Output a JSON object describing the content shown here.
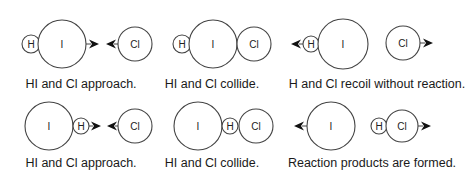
{
  "diagram": {
    "colors": {
      "stroke": "#444444",
      "arrow": "#111111",
      "text": "#1a1a1a",
      "background": "#ffffff"
    },
    "rows": [
      {
        "name": "unfavorable-orientation",
        "panels": [
          {
            "caption": "HI and Cl approach.",
            "caption_x": 81,
            "caption_y": 88,
            "atoms": [
              {
                "label": "H",
                "cx": 31,
                "cy": 44,
                "r": 9
              },
              {
                "label": "I",
                "cx": 62,
                "cy": 44,
                "r": 24
              },
              {
                "label": "Cl",
                "cx": 135,
                "cy": 44,
                "r": 17
              }
            ],
            "arrows": [
              {
                "from": 86,
                "to": 99,
                "y": 44,
                "dir": "right"
              },
              {
                "from": 118,
                "to": 106,
                "y": 44,
                "dir": "left"
              }
            ]
          },
          {
            "caption": "HI and Cl collide.",
            "caption_x": 212,
            "caption_y": 88,
            "atoms": [
              {
                "label": "H",
                "cx": 182,
                "cy": 44,
                "r": 9
              },
              {
                "label": "I",
                "cx": 213,
                "cy": 44,
                "r": 24
              },
              {
                "label": "Cl",
                "cx": 254,
                "cy": 44,
                "r": 17
              }
            ],
            "arrows": []
          },
          {
            "caption": "H and Cl recoil without reaction.",
            "caption_x": 377,
            "caption_y": 88,
            "atoms": [
              {
                "label": "H",
                "cx": 311,
                "cy": 44,
                "r": 8
              },
              {
                "label": "I",
                "cx": 343,
                "cy": 44,
                "r": 25
              },
              {
                "label": "Cl",
                "cx": 403,
                "cy": 43,
                "r": 17
              }
            ],
            "arrows": [
              {
                "from": 303,
                "to": 291,
                "y": 44,
                "dir": "left"
              },
              {
                "from": 420,
                "to": 433,
                "y": 43,
                "dir": "right"
              }
            ]
          }
        ]
      },
      {
        "name": "favorable-orientation",
        "panels": [
          {
            "caption": "HI and Cl approach.",
            "caption_x": 81,
            "caption_y": 167,
            "atoms": [
              {
                "label": "I",
                "cx": 49,
                "cy": 126,
                "r": 24
              },
              {
                "label": "H",
                "cx": 81,
                "cy": 126,
                "r": 8
              },
              {
                "label": "Cl",
                "cx": 135,
                "cy": 126,
                "r": 17
              }
            ],
            "arrows": [
              {
                "from": 89,
                "to": 101,
                "y": 126,
                "dir": "right"
              },
              {
                "from": 118,
                "to": 107,
                "y": 126,
                "dir": "left"
              }
            ]
          },
          {
            "caption": "HI and Cl collide.",
            "caption_x": 212,
            "caption_y": 167,
            "atoms": [
              {
                "label": "I",
                "cx": 198,
                "cy": 126,
                "r": 24
              },
              {
                "label": "H",
                "cx": 230,
                "cy": 126,
                "r": 8
              },
              {
                "label": "Cl",
                "cx": 256,
                "cy": 126,
                "r": 17
              }
            ],
            "arrows": []
          },
          {
            "caption": "Reaction products are formed.",
            "caption_x": 372,
            "caption_y": 167,
            "atoms": [
              {
                "label": "I",
                "cx": 331,
                "cy": 126,
                "r": 24
              },
              {
                "label": "H",
                "cx": 379,
                "cy": 126,
                "r": 8
              },
              {
                "label": "Cl",
                "cx": 402,
                "cy": 126,
                "r": 16
              }
            ],
            "arrows": [
              {
                "from": 307,
                "to": 294,
                "y": 126,
                "dir": "left"
              },
              {
                "from": 418,
                "to": 431,
                "y": 126,
                "dir": "right"
              }
            ]
          }
        ]
      }
    ]
  }
}
